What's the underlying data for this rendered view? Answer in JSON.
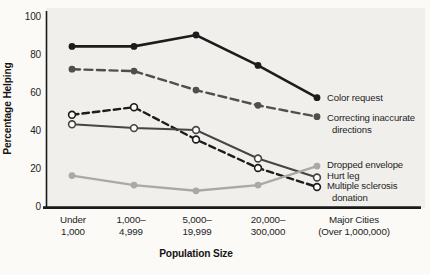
{
  "figure": {
    "type": "scanned textbook line chart"
  },
  "chart_data": {
    "type": "line",
    "title": "",
    "xlabel": "Population Size",
    "ylabel": "Percentage Helping",
    "ylim": [
      0,
      100
    ],
    "grid": false,
    "legend_position": "right of line endpoints",
    "yticks": [
      100,
      80,
      60,
      40,
      20,
      0
    ],
    "categories": [
      "Under 1,000",
      "1,000–4,999",
      "5,000–19,999",
      "20,000–300,000",
      "Major Cities (Over 1,000,000)"
    ],
    "x_tick_labels": [
      {
        "line1": "Under",
        "line2": "1,000"
      },
      {
        "line1": "1,000–",
        "line2": "4,999"
      },
      {
        "line1": "5,000–",
        "line2": "19,999"
      },
      {
        "line1": "20,000–",
        "line2": "300,000"
      },
      {
        "line1": "Major Cities",
        "line2": "(Over 1,000,000)"
      }
    ],
    "series": [
      {
        "name": "Color request",
        "values": [
          84,
          84,
          90,
          74,
          57
        ],
        "color": "#1c1c1c",
        "style": "solid",
        "dash": "",
        "marker": "filled",
        "width": 2.6
      },
      {
        "name": "Correcting inaccurate directions",
        "values": [
          72,
          71,
          61,
          53,
          47
        ],
        "color": "#4f4f4d",
        "style": "dashed",
        "dash": "8 4.5",
        "marker": "filled",
        "width": 2.4
      },
      {
        "name": "Dropped envelope",
        "values": [
          16,
          11,
          8,
          11,
          21
        ],
        "color": "#a9a9a5",
        "style": "solid",
        "dash": "",
        "marker": "filled",
        "width": 2.4
      },
      {
        "name": "Hurt leg",
        "values": [
          43,
          41,
          40,
          25,
          15
        ],
        "color": "#454543",
        "style": "solid",
        "dash": "",
        "marker": "open",
        "width": 2
      },
      {
        "name": "Multiple sclerosis donation",
        "values": [
          48,
          52,
          35,
          20,
          10
        ],
        "color": "#1c1c1c",
        "style": "dashed",
        "dash": "6.5 4",
        "marker": "open",
        "width": 2.4
      }
    ],
    "legend": [
      {
        "lines": [
          "Color request"
        ]
      },
      {
        "lines": [
          "Correcting inaccurate",
          "directions"
        ]
      },
      {
        "lines": [
          "Dropped envelope"
        ]
      },
      {
        "lines": [
          "Hurt leg"
        ]
      },
      {
        "lines": [
          "Multiple sclerosis",
          "donation"
        ]
      }
    ],
    "colors": {
      "panel_background": "#f0efec",
      "page_background": "#fbfaf7",
      "axis": "#1a1a1a",
      "black_series": "#1c1c1c",
      "dark_gray_series": "#4f4f4d",
      "light_gray_series": "#a9a9a5"
    }
  }
}
